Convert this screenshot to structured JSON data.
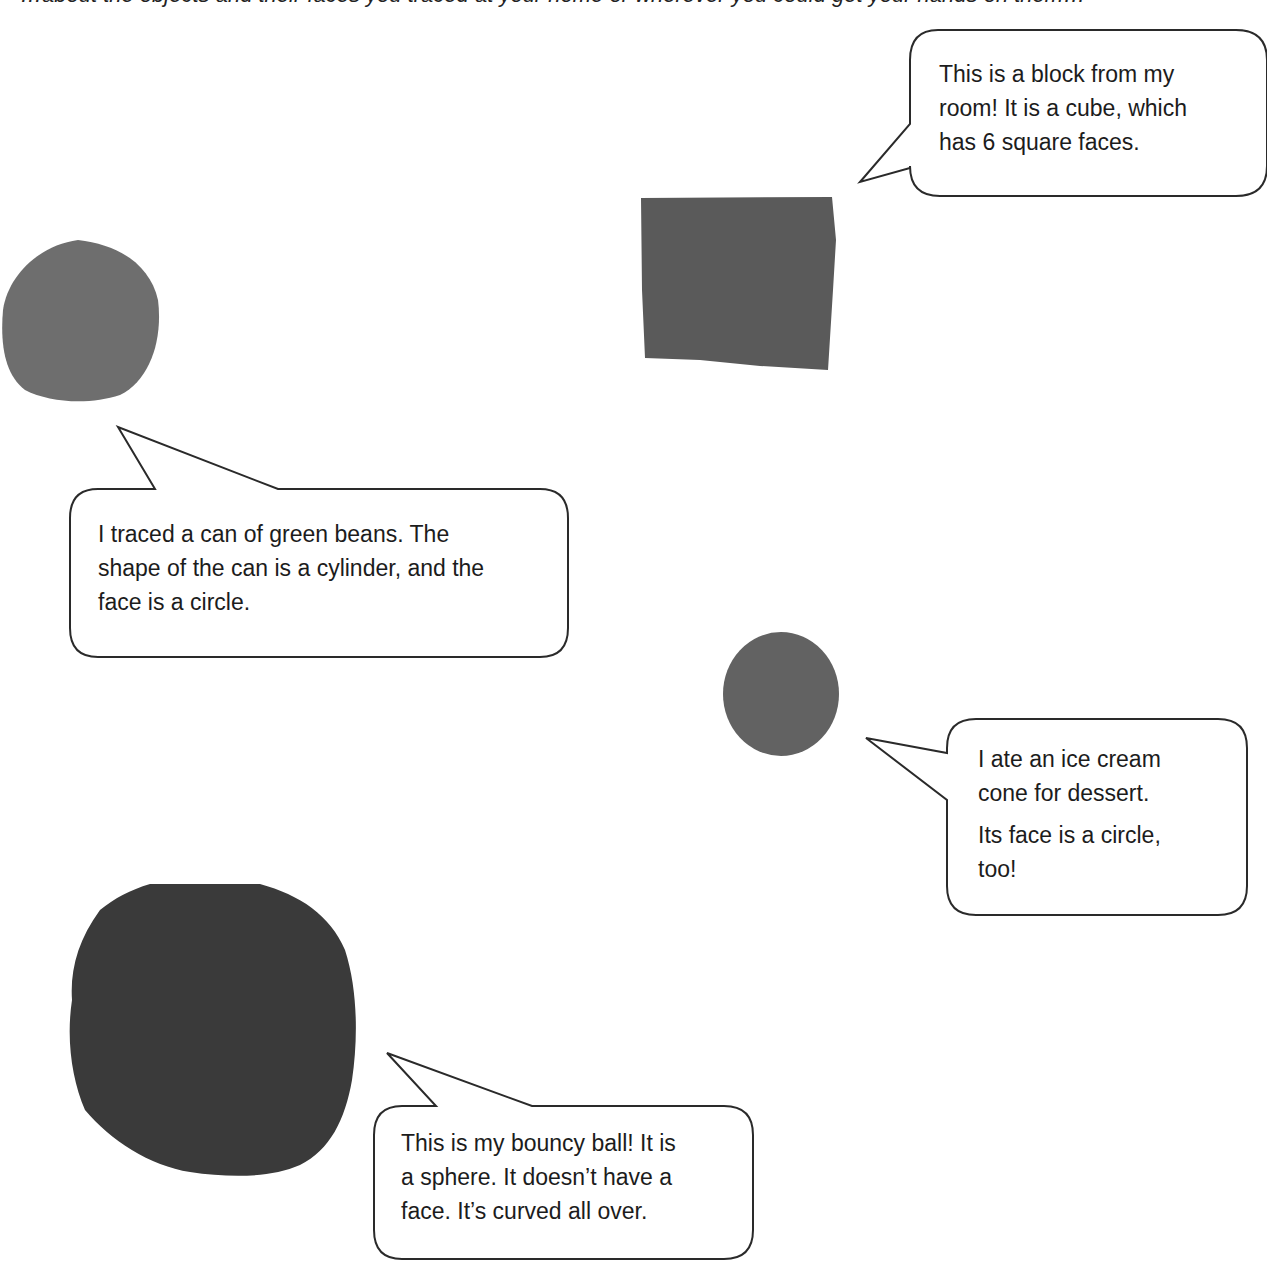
{
  "page": {
    "top_text_cutoff": "…about the objects and their faces you traced at your home or wherever you could get your hands on them…"
  },
  "colors": {
    "background": "#ffffff",
    "cube_face": "#5a5a5a",
    "can_face": "#6e6e6e",
    "cone_face": "#626262",
    "ball_trace": "#3a3a3a",
    "bubble_stroke": "#2a2a2a"
  },
  "tracings": [
    {
      "name": "cube-tracing",
      "shape": "square"
    },
    {
      "name": "can-tracing",
      "shape": "circle"
    },
    {
      "name": "cone-tracing",
      "shape": "circle"
    },
    {
      "name": "ball-tracing",
      "shape": "irregular-round"
    }
  ],
  "bubbles": {
    "cube": {
      "lines": [
        "This is a block from my",
        "room!  It is a cube, which",
        "has 6 square faces."
      ]
    },
    "can": {
      "lines": [
        "I traced a can of green beans.  The",
        "shape of the can is a cylinder, and the",
        "face is a circle."
      ]
    },
    "cone": {
      "lines": [
        "I ate an ice cream",
        "cone for dessert.",
        "Its face is a circle,",
        "too!"
      ]
    },
    "ball": {
      "lines": [
        "This is my bouncy ball!  It is",
        "a sphere.  It doesn’t have a",
        "face.  It’s curved all over."
      ]
    }
  }
}
